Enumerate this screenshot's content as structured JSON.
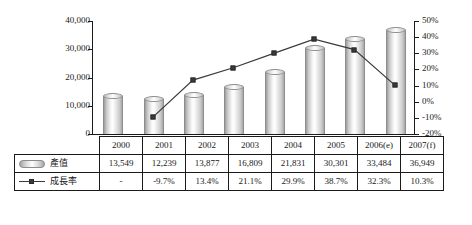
{
  "chart_data": {
    "type": "bar",
    "title": "",
    "subtitle": "",
    "xlabel": "",
    "ylabel": "",
    "categories": [
      "2000",
      "2001",
      "2002",
      "2003",
      "2004",
      "2005",
      "2006(e)",
      "2007(f)"
    ],
    "grid": false,
    "legend_position": "table-left",
    "axes": {
      "left": {
        "type": "value",
        "ticks": [
          "0",
          "10,000",
          "20,000",
          "30,000",
          "40,000"
        ],
        "tick_values": [
          0,
          10000,
          20000,
          30000,
          40000
        ],
        "ylim": [
          0,
          40000
        ]
      },
      "right": {
        "type": "percent",
        "ticks": [
          "-20%",
          "-10%",
          "0%",
          "10%",
          "20%",
          "30%",
          "40%",
          "50%"
        ],
        "tick_values": [
          -20,
          -10,
          0,
          10,
          20,
          30,
          40,
          50
        ],
        "ylim": [
          -20,
          50
        ]
      }
    },
    "series": [
      {
        "name": "產值",
        "kind": "bar",
        "axis": "left",
        "color": "#d0d0d0",
        "values": [
          13549,
          12239,
          13877,
          16809,
          21831,
          30301,
          33484,
          36949
        ],
        "labels": [
          "13,549",
          "12,239",
          "13,877",
          "16,809",
          "21,831",
          "30,301",
          "33,484",
          "36,949"
        ]
      },
      {
        "name": "成長率",
        "kind": "line",
        "axis": "right",
        "color": "#3a3a3a",
        "marker": "square",
        "values": [
          null,
          -9.7,
          13.4,
          21.1,
          29.9,
          38.7,
          32.3,
          10.3
        ],
        "labels": [
          "-",
          "-9.7%",
          "13.4%",
          "21.1%",
          "29.9%",
          "38.7%",
          "32.3%",
          "10.3%"
        ]
      }
    ]
  },
  "table": {
    "rows": [
      {
        "legend_label": "",
        "legend_icon": "",
        "cells": [
          "2000",
          "2001",
          "2002",
          "2003",
          "2004",
          "2005",
          "2006(e)",
          "2007(f)"
        ]
      },
      {
        "legend_label": "產值",
        "legend_icon": "bar-swatch-icon",
        "cells": [
          "13,549",
          "12,239",
          "13,877",
          "16,809",
          "21,831",
          "30,301",
          "33,484",
          "36,949"
        ]
      },
      {
        "legend_label": "成長率",
        "legend_icon": "line-marker-swatch-icon",
        "cells": [
          "-",
          "-9.7%",
          "13.4%",
          "21.1%",
          "29.9%",
          "38.7%",
          "32.3%",
          "10.3%"
        ]
      }
    ]
  }
}
